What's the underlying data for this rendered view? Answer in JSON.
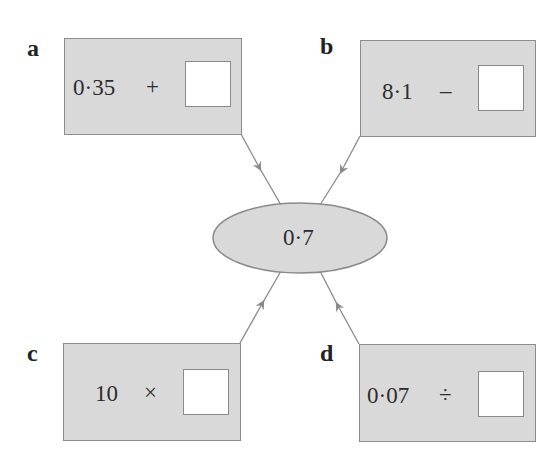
{
  "diagram": {
    "center": {
      "value": "0·7"
    },
    "boxes": [
      {
        "label": "a",
        "number": "0·35",
        "operator": "+",
        "answer": ""
      },
      {
        "label": "b",
        "number": "8·1",
        "operator": "–",
        "answer": ""
      },
      {
        "label": "c",
        "number": "10",
        "operator": "×",
        "answer": ""
      },
      {
        "label": "d",
        "number": "0·07",
        "operator": "÷",
        "answer": ""
      }
    ]
  },
  "colors": {
    "box_fill": "#d9d9d9",
    "box_border": "#8c8c8c",
    "line": "#8a8a8a",
    "blank_fill": "#ffffff"
  }
}
